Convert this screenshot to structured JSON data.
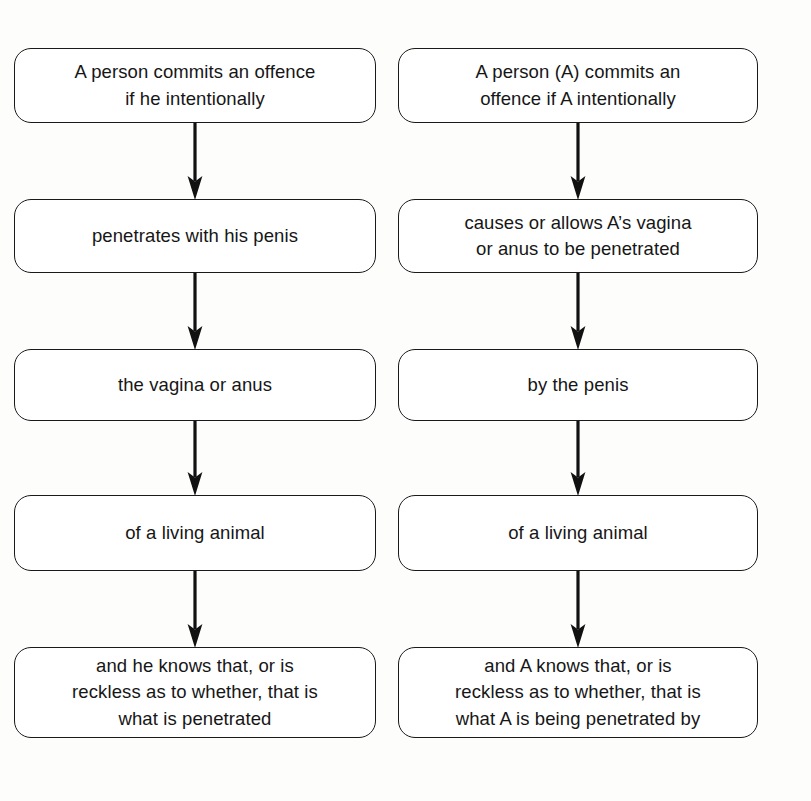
{
  "diagram": {
    "type": "flowchart",
    "orientation": "two parallel vertical chains",
    "columns": [
      {
        "id": "left",
        "name": "offence-chain-he",
        "nodes": [
          {
            "id": "l1",
            "lines": [
              "A person commits an offence",
              "if he intentionally"
            ]
          },
          {
            "id": "l2",
            "lines": [
              "penetrates with his penis"
            ]
          },
          {
            "id": "l3",
            "lines": [
              "the vagina or anus"
            ]
          },
          {
            "id": "l4",
            "lines": [
              "of a living animal"
            ]
          },
          {
            "id": "l5",
            "lines": [
              "and he knows that, or is",
              "reckless as to whether, that is",
              "what is penetrated"
            ]
          }
        ],
        "connectors": [
          "arrow-down",
          "arrow-down",
          "arrow-down",
          "arrow-down"
        ]
      },
      {
        "id": "right",
        "name": "offence-chain-a",
        "nodes": [
          {
            "id": "r1",
            "lines": [
              "A person (A) commits an",
              "offence if A intentionally"
            ]
          },
          {
            "id": "r2",
            "lines": [
              "causes or allows A’s vagina",
              "or anus to be penetrated"
            ]
          },
          {
            "id": "r3",
            "lines": [
              "by the penis"
            ]
          },
          {
            "id": "r4",
            "lines": [
              "of a living animal"
            ]
          },
          {
            "id": "r5",
            "lines": [
              "and A knows that, or is",
              "reckless as to whether, that is",
              "what A is being penetrated by"
            ]
          }
        ],
        "connectors": [
          "arrow-down",
          "arrow-down",
          "arrow-down",
          "arrow-down"
        ]
      }
    ],
    "colors": {
      "page_background": "#fdfdfc",
      "node_fill": "#ffffff",
      "node_border": "#1a1a1a",
      "text": "#161616",
      "arrow": "#111111"
    }
  }
}
